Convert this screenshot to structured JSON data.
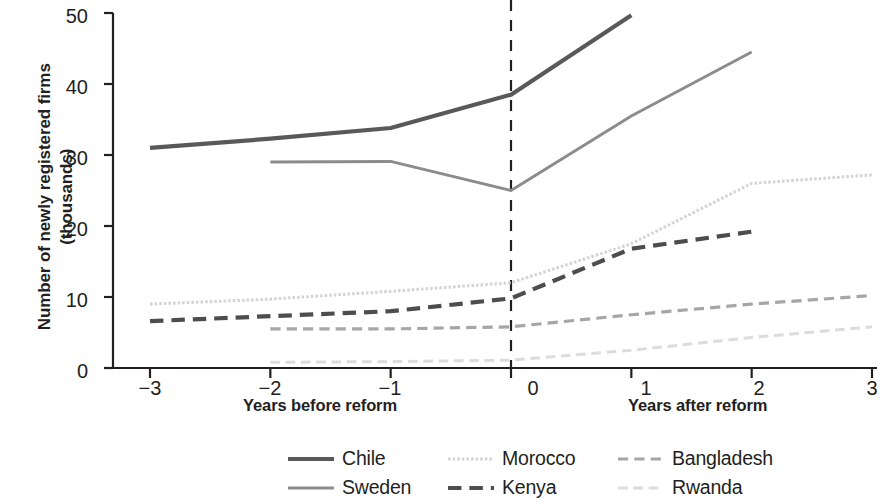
{
  "chart_data": {
    "type": "line",
    "title": "",
    "xlabel_left": "Years before reform",
    "xlabel_right": "Years after reform",
    "ylabel": "Number of newly registered firms (thousands)",
    "x": [
      -3,
      -2,
      -1,
      0,
      1,
      2,
      3
    ],
    "xticks": [
      "−3",
      "−2",
      "−1",
      "0",
      "1",
      "2",
      "3"
    ],
    "yticks": [
      "0",
      "10",
      "20",
      "30",
      "40",
      "50"
    ],
    "xlim": [
      -3.35,
      3
    ],
    "ylim": [
      0,
      50
    ],
    "grid": false,
    "legend_position": "bottom",
    "reform_line_x": 0,
    "reform_line_style": "dashed",
    "series": [
      {
        "name": "Chile",
        "color": "#595959",
        "style": "solid",
        "width": 4.2,
        "x": [
          -3,
          -2,
          -1,
          0,
          1
        ],
        "values": [
          31.0,
          32.3,
          33.8,
          38.5,
          49.7
        ]
      },
      {
        "name": "Sweden",
        "color": "#8c8c8c",
        "style": "solid",
        "width": 3.0,
        "x": [
          -2,
          -1,
          0,
          1,
          2
        ],
        "values": [
          29.0,
          29.1,
          25.0,
          35.5,
          44.5
        ]
      },
      {
        "name": "Morocco",
        "color": "#d4d4d4",
        "style": "dotted",
        "width": 3.0,
        "x": [
          -3,
          -2,
          -1,
          0,
          1,
          2,
          3
        ],
        "values": [
          9.0,
          9.7,
          10.8,
          12.0,
          17.5,
          26.0,
          27.2
        ]
      },
      {
        "name": "Kenya",
        "color": "#4d4d4d",
        "style": "dashed",
        "width": 4.2,
        "x": [
          -3,
          -2,
          -1,
          0,
          1,
          2
        ],
        "values": [
          6.6,
          7.3,
          8.0,
          9.8,
          16.8,
          19.2
        ]
      },
      {
        "name": "Bangladesh",
        "color": "#a6a6a6",
        "style": "dashed",
        "width": 3.2,
        "x": [
          -2,
          -1,
          0,
          1,
          2,
          3
        ],
        "values": [
          5.5,
          5.5,
          5.8,
          7.5,
          9.0,
          10.2
        ]
      },
      {
        "name": "Rwanda",
        "color": "#dcdcdc",
        "style": "dashed",
        "width": 3.0,
        "x": [
          -2,
          -1,
          0,
          1,
          2,
          3
        ],
        "values": [
          0.8,
          0.9,
          1.1,
          2.5,
          4.3,
          5.8
        ]
      }
    ]
  },
  "axis": {
    "y_title": "Number of newly registered firms (thousands)",
    "y_ticks": [
      "50",
      "40",
      "30",
      "20",
      "10",
      "0"
    ],
    "x_ticks": [
      "−3",
      "−2",
      "−1",
      "0",
      "1",
      "2",
      "3"
    ],
    "x_title_left": "Years before reform",
    "x_title_right": "Years after reform"
  },
  "legend": {
    "row1": [
      {
        "label": "Chile",
        "icon": "solid-line-swatch"
      },
      {
        "label": "Morocco",
        "icon": "dotted-line-swatch"
      },
      {
        "label": "Bangladesh",
        "icon": "dashed-line-swatch"
      }
    ],
    "row2": [
      {
        "label": "Sweden",
        "icon": "solid-line-swatch"
      },
      {
        "label": "Kenya",
        "icon": "dashed-line-swatch"
      },
      {
        "label": "Rwanda",
        "icon": "dashed-line-swatch"
      }
    ]
  },
  "colors": {
    "axis": "#231f20",
    "chile": "#595959",
    "sweden": "#8c8c8c",
    "morocco": "#d4d4d4",
    "kenya": "#4d4d4d",
    "bangladesh": "#a6a6a6",
    "rwanda": "#dcdcdc"
  }
}
